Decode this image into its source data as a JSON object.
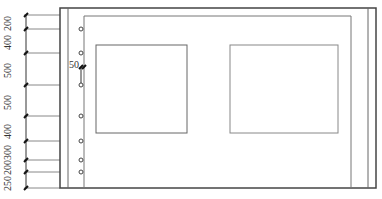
{
  "diagram": {
    "type": "wall-elevation",
    "colors": {
      "line": "#555555",
      "frame": "#444444",
      "tick": "#222222"
    },
    "dimensions": {
      "segments": [
        {
          "label": "200",
          "y1": 15,
          "y2": 29
        },
        {
          "label": "400",
          "y1": 29,
          "y2": 53
        },
        {
          "label": "500",
          "y1": 53,
          "y2": 85
        },
        {
          "label": "500",
          "y1": 85,
          "y2": 116
        },
        {
          "label": "400",
          "y1": 116,
          "y2": 141
        },
        {
          "label": "300",
          "y1": 141,
          "y2": 160
        },
        {
          "label": "200",
          "y1": 160,
          "y2": 172
        },
        {
          "label": "250",
          "y1": 172,
          "y2": 188
        }
      ]
    },
    "annotation": {
      "label": "50"
    },
    "windows": [
      {
        "name": "left-window",
        "x": 96,
        "y": 45,
        "w": 91,
        "h": 88
      },
      {
        "name": "right-window",
        "x": 230,
        "y": 45,
        "w": 108,
        "h": 88
      }
    ],
    "anchors": [
      29,
      53,
      85,
      116,
      141,
      160,
      172
    ]
  }
}
